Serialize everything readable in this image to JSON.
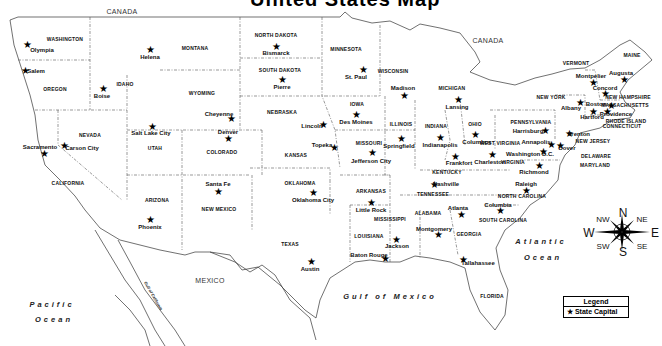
{
  "title_fragment": "United States Map",
  "countries": [
    {
      "label": "CANADA",
      "x": 122,
      "y": 11
    },
    {
      "label": "CANADA",
      "x": 488,
      "y": 40
    },
    {
      "label": "MEXICO",
      "x": 210,
      "y": 280
    }
  ],
  "water_bodies": [
    {
      "label": "Pacific",
      "x": 52,
      "y": 305
    },
    {
      "label": "Ocean",
      "x": 54,
      "y": 320
    },
    {
      "label": "Atlantic",
      "x": 541,
      "y": 242
    },
    {
      "label": "Ocean",
      "x": 543,
      "y": 258
    },
    {
      "label": "Gulf of Mexico",
      "x": 390,
      "y": 297
    },
    {
      "label": "Gulf of California",
      "x": 153,
      "y": 296,
      "rotate": 60
    }
  ],
  "states": [
    {
      "label": "WASHINGTON",
      "x": 65,
      "y": 39
    },
    {
      "label": "OREGON",
      "x": 55,
      "y": 89
    },
    {
      "label": "CALIFORNIA",
      "x": 68,
      "y": 183
    },
    {
      "label": "NEVADA",
      "x": 90,
      "y": 135
    },
    {
      "label": "IDAHO",
      "x": 125,
      "y": 84
    },
    {
      "label": "MONTANA",
      "x": 195,
      "y": 48
    },
    {
      "label": "WYOMING",
      "x": 202,
      "y": 93
    },
    {
      "label": "UTAH",
      "x": 155,
      "y": 148
    },
    {
      "label": "ARIZONA",
      "x": 157,
      "y": 200
    },
    {
      "label": "COLORADO",
      "x": 222,
      "y": 152
    },
    {
      "label": "NEW MEXICO",
      "x": 219,
      "y": 209
    },
    {
      "label": "NORTH DAKOTA",
      "x": 276,
      "y": 35
    },
    {
      "label": "SOUTH DAKOTA",
      "x": 280,
      "y": 70
    },
    {
      "label": "NEBRASKA",
      "x": 282,
      "y": 112
    },
    {
      "label": "KANSAS",
      "x": 296,
      "y": 155
    },
    {
      "label": "OKLAHOMA",
      "x": 300,
      "y": 183
    },
    {
      "label": "TEXAS",
      "x": 290,
      "y": 244
    },
    {
      "label": "MINNESOTA",
      "x": 346,
      "y": 49
    },
    {
      "label": "IOWA",
      "x": 357,
      "y": 104
    },
    {
      "label": "MISSOURI",
      "x": 369,
      "y": 143
    },
    {
      "label": "ARKANSAS",
      "x": 371,
      "y": 191
    },
    {
      "label": "LOUISIANA",
      "x": 369,
      "y": 236
    },
    {
      "label": "WISCONSIN",
      "x": 393,
      "y": 71
    },
    {
      "label": "ILLINOIS",
      "x": 401,
      "y": 124
    },
    {
      "label": "MICHIGAN",
      "x": 452,
      "y": 88
    },
    {
      "label": "INDIANA",
      "x": 436,
      "y": 126
    },
    {
      "label": "OHIO",
      "x": 475,
      "y": 124
    },
    {
      "label": "KENTUCKY",
      "x": 447,
      "y": 172
    },
    {
      "label": "TENNESSEE",
      "x": 433,
      "y": 194
    },
    {
      "label": "MISSISSIPPI",
      "x": 390,
      "y": 219
    },
    {
      "label": "ALABAMA",
      "x": 428,
      "y": 213
    },
    {
      "label": "GEORGIA",
      "x": 469,
      "y": 234
    },
    {
      "label": "WEST VIRGINIA",
      "x": 500,
      "y": 143
    },
    {
      "label": "VIRGINIA",
      "x": 513,
      "y": 162
    },
    {
      "label": "NORTH CAROLINA",
      "x": 522,
      "y": 196
    },
    {
      "label": "SOUTH CAROLINA",
      "x": 503,
      "y": 220
    },
    {
      "label": "FLORIDA",
      "x": 492,
      "y": 296
    },
    {
      "label": "PENNSYLVANIA",
      "x": 531,
      "y": 122
    },
    {
      "label": "NEW YORK",
      "x": 551,
      "y": 97
    },
    {
      "label": "VERMONT",
      "x": 576,
      "y": 63
    },
    {
      "label": "MAINE",
      "x": 632,
      "y": 55
    },
    {
      "label": "NEW HAMPSHIRE",
      "x": 628,
      "y": 97
    },
    {
      "label": "MASSACHUSETTS",
      "x": 625,
      "y": 105
    },
    {
      "label": "RHODE ISLAND",
      "x": 626,
      "y": 121
    },
    {
      "label": "CONNECTICUT",
      "x": 622,
      "y": 126
    },
    {
      "label": "NEW JERSEY",
      "x": 593,
      "y": 141
    },
    {
      "label": "DELAWARE",
      "x": 596,
      "y": 156
    },
    {
      "label": "MARYLAND",
      "x": 595,
      "y": 165
    }
  ],
  "capitals": [
    {
      "label": "Olympia",
      "sx": 27,
      "sy": 45,
      "lx": 42,
      "ly": 50
    },
    {
      "label": "Salem",
      "sx": 25,
      "sy": 71,
      "lx": 36,
      "ly": 71
    },
    {
      "label": "Sacramento",
      "sx": 44,
      "sy": 154,
      "lx": 40,
      "ly": 147
    },
    {
      "label": "Carson City",
      "sx": 64,
      "sy": 146,
      "lx": 82,
      "ly": 148
    },
    {
      "label": "Boise",
      "sx": 103,
      "sy": 89,
      "lx": 102,
      "ly": 96
    },
    {
      "label": "Helena",
      "sx": 150,
      "sy": 50,
      "lx": 150,
      "ly": 57
    },
    {
      "label": "Salt Lake City",
      "sx": 152,
      "sy": 127,
      "lx": 151,
      "ly": 133
    },
    {
      "label": "Cheyenne",
      "sx": 231,
      "sy": 119,
      "lx": 219,
      "ly": 114
    },
    {
      "label": "Denver",
      "sx": 228,
      "sy": 139,
      "lx": 228,
      "ly": 132
    },
    {
      "label": "Phoenix",
      "sx": 150,
      "sy": 220,
      "lx": 150,
      "ly": 227
    },
    {
      "label": "Santa Fe",
      "sx": 218,
      "sy": 192,
      "lx": 218,
      "ly": 184
    },
    {
      "label": "Bismarck",
      "sx": 276,
      "sy": 47,
      "lx": 276,
      "ly": 53
    },
    {
      "label": "Pierre",
      "sx": 282,
      "sy": 80,
      "lx": 282,
      "ly": 87
    },
    {
      "label": "Lincoln",
      "sx": 323,
      "sy": 125,
      "lx": 312,
      "ly": 126
    },
    {
      "label": "Topeka",
      "sx": 334,
      "sy": 148,
      "lx": 322,
      "ly": 145
    },
    {
      "label": "Oklahoma City",
      "sx": 313,
      "sy": 193,
      "lx": 313,
      "ly": 200
    },
    {
      "label": "Austin",
      "sx": 311,
      "sy": 262,
      "lx": 310,
      "ly": 269
    },
    {
      "label": "St. Paul",
      "sx": 363,
      "sy": 70,
      "lx": 356,
      "ly": 77
    },
    {
      "label": "Des Moines",
      "sx": 356,
      "sy": 115,
      "lx": 356,
      "ly": 122
    },
    {
      "label": "Madison",
      "sx": 404,
      "sy": 96,
      "lx": 403,
      "ly": 88
    },
    {
      "label": "Jefferson City",
      "sx": 372,
      "sy": 153,
      "lx": 371,
      "ly": 161
    },
    {
      "label": "Little Rock",
      "sx": 371,
      "sy": 203,
      "lx": 371,
      "ly": 210
    },
    {
      "label": "Jackson",
      "sx": 396,
      "sy": 240,
      "lx": 397,
      "ly": 246
    },
    {
      "label": "Baton Rouge",
      "sx": 385,
      "sy": 259,
      "lx": 369,
      "ly": 255
    },
    {
      "label": "Lansing",
      "sx": 458,
      "sy": 100,
      "lx": 457,
      "ly": 107
    },
    {
      "label": "Springfield",
      "sx": 401,
      "sy": 139,
      "lx": 399,
      "ly": 146
    },
    {
      "label": "Indianapolis",
      "sx": 440,
      "sy": 138,
      "lx": 440,
      "ly": 145
    },
    {
      "label": "Columbus",
      "sx": 475,
      "sy": 135,
      "lx": 477,
      "ly": 142
    },
    {
      "label": "Frankfort",
      "sx": 455,
      "sy": 157,
      "lx": 459,
      "ly": 163
    },
    {
      "label": "Charleston",
      "sx": 492,
      "sy": 155,
      "lx": 490,
      "ly": 162
    },
    {
      "label": "Nashville",
      "sx": 434,
      "sy": 185,
      "lx": 446,
      "ly": 184
    },
    {
      "label": "Montgomery",
      "sx": 438,
      "sy": 235,
      "lx": 434,
      "ly": 229
    },
    {
      "label": "Atlanta",
      "sx": 461,
      "sy": 215,
      "lx": 458,
      "ly": 208
    },
    {
      "label": "Tallahassee",
      "sx": 463,
      "sy": 260,
      "lx": 478,
      "ly": 263
    },
    {
      "label": "Columbia",
      "sx": 500,
      "sy": 211,
      "lx": 498,
      "ly": 205
    },
    {
      "label": "Raleigh",
      "sx": 526,
      "sy": 191,
      "lx": 526,
      "ly": 184
    },
    {
      "label": "Richmond",
      "sx": 539,
      "sy": 166,
      "lx": 534,
      "ly": 172
    },
    {
      "label": "Washington D.C.",
      "sx": 543,
      "sy": 152,
      "lx": 530,
      "ly": 154
    },
    {
      "label": "Annapolis",
      "sx": 551,
      "sy": 145,
      "lx": 536,
      "ly": 142
    },
    {
      "label": "Dover",
      "sx": 560,
      "sy": 146,
      "lx": 567,
      "ly": 148
    },
    {
      "label": "Harrisburg",
      "sx": 545,
      "sy": 131,
      "lx": 528,
      "ly": 131
    },
    {
      "label": "Trenton",
      "sx": 569,
      "sy": 134,
      "lx": 579,
      "ly": 134
    },
    {
      "label": "Albany",
      "sx": 580,
      "sy": 103,
      "lx": 571,
      "ly": 108
    },
    {
      "label": "Montpelier",
      "sx": 593,
      "sy": 83,
      "lx": 591,
      "ly": 76
    },
    {
      "label": "Concord",
      "sx": 605,
      "sy": 94,
      "lx": 605,
      "ly": 88
    },
    {
      "label": "Augusta",
      "sx": 624,
      "sy": 80,
      "lx": 621,
      "ly": 73
    },
    {
      "label": "Boston",
      "sx": 611,
      "sy": 106,
      "lx": 596,
      "ly": 104
    },
    {
      "label": "Hartford",
      "sx": 593,
      "sy": 112,
      "lx": 592,
      "ly": 117
    },
    {
      "label": "Providence",
      "sx": 607,
      "sy": 112,
      "lx": 616,
      "ly": 114
    }
  ],
  "compass": {
    "cx": 622,
    "cy": 232,
    "labels": [
      {
        "label": "N",
        "x": 623,
        "y": 213,
        "big": true
      },
      {
        "label": "S",
        "x": 623,
        "y": 252,
        "big": true
      },
      {
        "label": "E",
        "x": 655,
        "y": 233,
        "big": true
      },
      {
        "label": "W",
        "x": 589,
        "y": 233,
        "big": true
      },
      {
        "label": "NW",
        "x": 603,
        "y": 219,
        "big": false
      },
      {
        "label": "NE",
        "x": 642,
        "y": 219,
        "big": false
      },
      {
        "label": "SW",
        "x": 603,
        "y": 246,
        "big": false
      },
      {
        "label": "SE",
        "x": 642,
        "y": 246,
        "big": false
      }
    ]
  },
  "legend": {
    "title": "Legend",
    "items": [
      {
        "icon": "star-icon",
        "symbol": "★",
        "label": "State Capital"
      }
    ]
  },
  "colors": {
    "ink": "#111111",
    "background": "#ffffff",
    "border": "#444444"
  }
}
